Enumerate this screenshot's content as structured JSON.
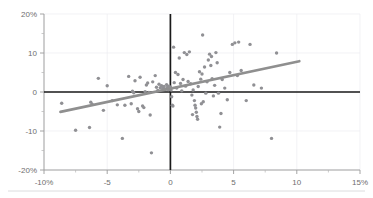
{
  "chart_data": {
    "type": "scatter",
    "title": "",
    "xlabel": "",
    "ylabel": "",
    "xlim": [
      -10,
      15
    ],
    "ylim": [
      -20,
      20
    ],
    "grid": true,
    "legend": null,
    "x_ticks": [
      -10,
      -5,
      0,
      5,
      10,
      15
    ],
    "x_tick_labels": [
      "-10%",
      "-5",
      "0",
      "5",
      "10",
      "15%"
    ],
    "y_ticks": [
      20,
      10,
      0,
      -10,
      -20
    ],
    "y_tick_labels": [
      "20%",
      "10",
      "0",
      "-10",
      "-20%"
    ],
    "x_minor_ticks": [
      -7.5,
      -2.5,
      2.5,
      7.5,
      12.5
    ],
    "y_minor_ticks": [
      15,
      5,
      -5,
      -15
    ],
    "reference_lines": [
      {
        "name": "zero-horizontal",
        "axis": "y",
        "value": 0,
        "color": "#1a1a1a"
      },
      {
        "name": "zero-vertical",
        "axis": "x",
        "value": 0,
        "color": "#1a1a1a"
      }
    ],
    "trend_line": {
      "name": "linear-fit",
      "color": "#8f8f8f",
      "x_start": -8.7,
      "y_start": -5.1,
      "x_end": 10.2,
      "y_end": 7.9
    },
    "marker_color": "#909094",
    "marker_radius": 1.7,
    "points": [
      [
        -8.6,
        -2.9
      ],
      [
        -7.5,
        -9.8
      ],
      [
        -6.4,
        -9.1
      ],
      [
        -6.3,
        -2.6
      ],
      [
        -6.2,
        -3.1
      ],
      [
        -5.7,
        3.5
      ],
      [
        -5.3,
        -4.7
      ],
      [
        -5.0,
        1.6
      ],
      [
        -4.6,
        -2.2
      ],
      [
        -4.2,
        -3.3
      ],
      [
        -3.8,
        -11.9
      ],
      [
        -3.6,
        -3.4
      ],
      [
        -3.3,
        4.0
      ],
      [
        -3.1,
        -3.0
      ],
      [
        -3.0,
        0.2
      ],
      [
        -2.9,
        -0.2
      ],
      [
        -2.8,
        2.9
      ],
      [
        -2.6,
        -4.3
      ],
      [
        -2.5,
        -5.0
      ],
      [
        -2.4,
        3.8
      ],
      [
        -2.2,
        -3.6
      ],
      [
        -2.0,
        0.1
      ],
      [
        -1.9,
        1.8
      ],
      [
        -1.8,
        2.3
      ],
      [
        -1.7,
        -0.1
      ],
      [
        -1.6,
        -5.9
      ],
      [
        -1.5,
        -15.6
      ],
      [
        -1.4,
        2.6
      ],
      [
        -1.2,
        4.2
      ],
      [
        -1.1,
        1.2
      ],
      [
        -1.0,
        0.4
      ],
      [
        -0.9,
        2.0
      ],
      [
        -0.8,
        1.1
      ],
      [
        -0.7,
        1.6
      ],
      [
        -0.6,
        0.9
      ],
      [
        -0.5,
        1.4
      ],
      [
        -0.4,
        0.7
      ],
      [
        -0.3,
        1.9
      ],
      [
        -0.25,
        1.0
      ],
      [
        -0.2,
        1.5
      ],
      [
        -0.15,
        0.6
      ],
      [
        -0.1,
        1.2
      ],
      [
        -0.05,
        0.9
      ],
      [
        0.0,
        1.3
      ],
      [
        0.05,
        0.5
      ],
      [
        0.1,
        -1.2
      ],
      [
        0.15,
        -3.4
      ],
      [
        0.2,
        -3.6
      ],
      [
        0.25,
        11.5
      ],
      [
        0.3,
        2.4
      ],
      [
        0.4,
        5.0
      ],
      [
        0.5,
        1.0
      ],
      [
        0.6,
        4.5
      ],
      [
        0.7,
        8.7
      ],
      [
        0.8,
        2.2
      ],
      [
        0.9,
        0.3
      ],
      [
        1.0,
        3.2
      ],
      [
        1.1,
        10.1
      ],
      [
        1.2,
        1.5
      ],
      [
        1.3,
        9.6
      ],
      [
        1.4,
        2.7
      ],
      [
        1.5,
        10.3
      ],
      [
        1.6,
        2.1
      ],
      [
        1.7,
        -0.8
      ],
      [
        1.8,
        0.5
      ],
      [
        1.9,
        -2.2
      ],
      [
        1.95,
        -3.4
      ],
      [
        2.0,
        -4.1
      ],
      [
        2.05,
        -5.2
      ],
      [
        2.1,
        -6.3
      ],
      [
        2.15,
        -7.0
      ],
      [
        2.2,
        1.4
      ],
      [
        2.3,
        5.2
      ],
      [
        2.4,
        3.3
      ],
      [
        2.5,
        4.6
      ],
      [
        2.55,
        14.6
      ],
      [
        2.6,
        -2.5
      ],
      [
        2.7,
        6.4
      ],
      [
        2.8,
        -0.3
      ],
      [
        2.9,
        2.6
      ],
      [
        3.0,
        8.2
      ],
      [
        3.1,
        9.7
      ],
      [
        3.2,
        6.8
      ],
      [
        3.25,
        9.1
      ],
      [
        3.3,
        3.4
      ],
      [
        3.4,
        -1.0
      ],
      [
        3.5,
        1.7
      ],
      [
        3.6,
        10.1
      ],
      [
        3.7,
        7.5
      ],
      [
        3.8,
        -0.3
      ],
      [
        3.9,
        -9.0
      ],
      [
        4.0,
        -5.5
      ],
      [
        4.1,
        3.2
      ],
      [
        4.3,
        1.0
      ],
      [
        4.5,
        -2.0
      ],
      [
        4.7,
        5.0
      ],
      [
        4.9,
        12.2
      ],
      [
        5.1,
        12.6
      ],
      [
        5.3,
        4.2
      ],
      [
        5.4,
        12.8
      ],
      [
        5.6,
        5.5
      ],
      [
        6.0,
        -2.2
      ],
      [
        6.3,
        12.2
      ],
      [
        6.6,
        1.8
      ],
      [
        7.2,
        1.0
      ],
      [
        8.0,
        -11.9
      ],
      [
        8.4,
        10.0
      ],
      [
        1.75,
        -5.8
      ],
      [
        2.45,
        -3.0
      ],
      [
        -2.1,
        -4.0
      ]
    ]
  },
  "elements": {
    "bottom_divider": "bottom-divider-rule"
  }
}
